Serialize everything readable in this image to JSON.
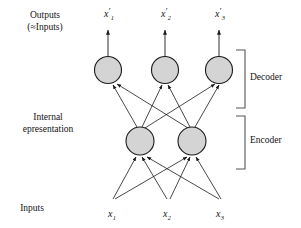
{
  "diagram": {
    "type": "autoencoder-network",
    "title_labels": {
      "outputs_line1": "Outputs",
      "outputs_line2": "(≈Inputs)",
      "internal_line1": "Internal",
      "internal_line2": "epresentation",
      "inputs": "Inputs"
    },
    "brackets": [
      {
        "name": "decoder",
        "label": "Decoder",
        "y_top": 50,
        "y_bottom": 108
      },
      {
        "name": "encoder",
        "label": "Encoder",
        "y_top": 116,
        "y_bottom": 169
      }
    ],
    "layers": [
      {
        "name": "output-layer",
        "role": "decoder-units",
        "node_count": 3,
        "nodes": [
          {
            "id": "out-1",
            "cx": 108,
            "cy": 70,
            "r": 13.5
          },
          {
            "id": "out-2",
            "cx": 165,
            "cy": 70,
            "r": 13.5
          },
          {
            "id": "out-3",
            "cx": 219,
            "cy": 70,
            "r": 13.5
          }
        ]
      },
      {
        "name": "hidden-layer",
        "role": "encoder-units",
        "node_count": 2,
        "nodes": [
          {
            "id": "hid-1",
            "cx": 140,
            "cy": 141,
            "r": 14
          },
          {
            "id": "hid-2",
            "cx": 192,
            "cy": 141,
            "r": 14
          }
        ]
      },
      {
        "name": "input-layer",
        "role": "inputs",
        "node_count": 3,
        "nodes": [
          {
            "id": "in-1",
            "cx": 113,
            "cy": 205
          },
          {
            "id": "in-2",
            "cx": 168,
            "cy": 205
          },
          {
            "id": "in-3",
            "cx": 221,
            "cy": 205
          }
        ]
      }
    ],
    "output_variables": [
      {
        "base": "x",
        "prime": "′",
        "sub": "1",
        "x": 104,
        "y": 8
      },
      {
        "base": "x",
        "prime": "′",
        "sub": "2",
        "x": 161,
        "y": 8
      },
      {
        "base": "x",
        "prime": "′",
        "sub": "3",
        "x": 215,
        "y": 8
      }
    ],
    "input_variables": [
      {
        "base": "x",
        "sub": "1",
        "x": 108,
        "y": 208
      },
      {
        "base": "x",
        "sub": "2",
        "x": 163,
        "y": 208
      },
      {
        "base": "x",
        "sub": "3",
        "x": 216,
        "y": 208
      }
    ],
    "output_arrows": [
      {
        "x": 108,
        "y_from": 56,
        "y_to": 30
      },
      {
        "x": 165,
        "y_from": 56,
        "y_to": 30
      },
      {
        "x": 219,
        "y_from": 56,
        "y_to": 30
      }
    ],
    "edges_hidden_to_output": [
      {
        "from": "hid-1",
        "to": "out-1"
      },
      {
        "from": "hid-1",
        "to": "out-2"
      },
      {
        "from": "hid-1",
        "to": "out-3"
      },
      {
        "from": "hid-2",
        "to": "out-1"
      },
      {
        "from": "hid-2",
        "to": "out-2"
      },
      {
        "from": "hid-2",
        "to": "out-3"
      }
    ],
    "edges_input_to_hidden": [
      {
        "from": "in-1",
        "to": "hid-1"
      },
      {
        "from": "in-1",
        "to": "hid-2"
      },
      {
        "from": "in-2",
        "to": "hid-1"
      },
      {
        "from": "in-2",
        "to": "hid-2"
      },
      {
        "from": "in-3",
        "to": "hid-1"
      },
      {
        "from": "in-3",
        "to": "hid-2"
      }
    ],
    "colors": {
      "node_fill": "#d4d4d4",
      "node_stroke": "#1a1a1a",
      "edge": "#1a1a1a",
      "bracket": "#555555",
      "background": "#ffffff",
      "text": "#141414"
    }
  }
}
